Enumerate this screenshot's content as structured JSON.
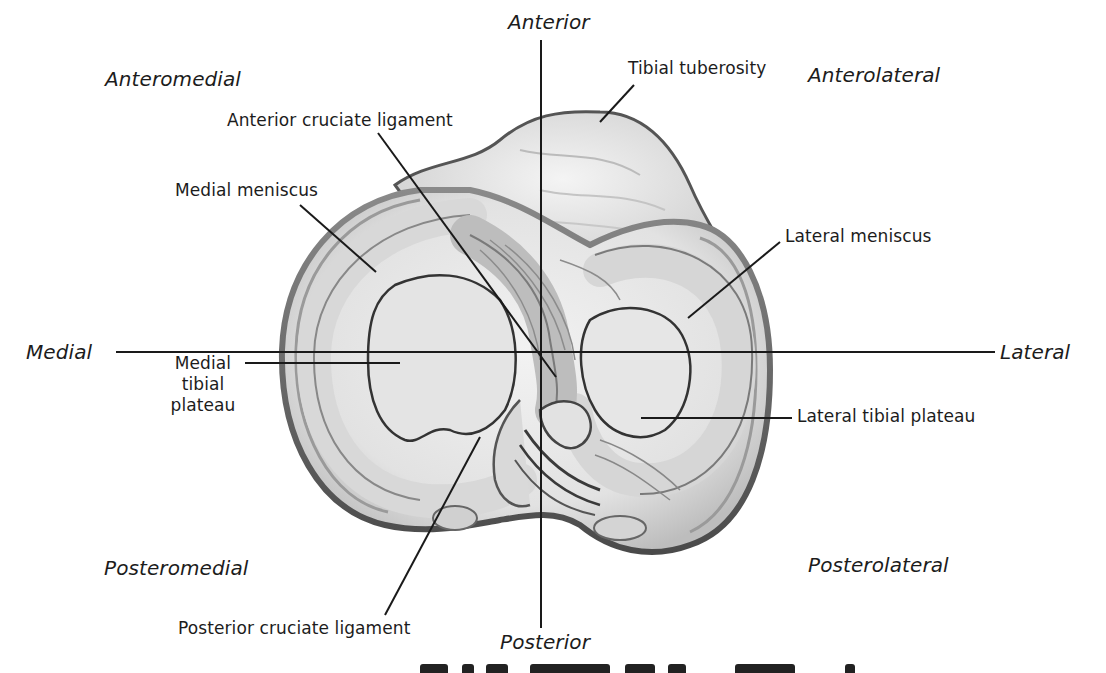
{
  "diagram": {
    "directions": {
      "anterior": "Anterior",
      "posterior": "Posterior",
      "medial": "Medial",
      "lateral": "Lateral",
      "anteromedial": "Anteromedial",
      "anterolateral": "Anterolateral",
      "posteromedial": "Posteromedial",
      "posterolateral": "Posterolateral"
    },
    "structures": {
      "tibial_tuberosity": "Tibial tuberosity",
      "acl": "Anterior cruciate ligament",
      "medial_meniscus": "Medial meniscus",
      "lateral_meniscus": "Lateral meniscus",
      "medial_tibial_plateau": [
        "Medial",
        "tibial",
        "plateau"
      ],
      "lateral_tibial_plateau": "Lateral tibial plateau",
      "pcl": "Posterior cruciate ligament"
    },
    "colors": {
      "ink": "#1c1c1c",
      "bone_light": "#ececec",
      "bone_mid": "#cfcfcf",
      "bone_dark": "#6a6a6a",
      "background": "#ffffff"
    }
  }
}
